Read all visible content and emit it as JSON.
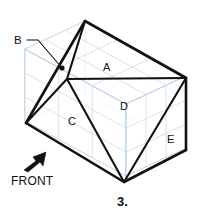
{
  "figure": {
    "number_label": "3.",
    "orientation_label": "FRONT",
    "callout_label": "B",
    "canvas": {
      "width": 197,
      "height": 217
    },
    "colors": {
      "background": "#ffffff",
      "grid": "#b9cfe4",
      "grid_faint": "#ccdcea",
      "edge": "#111111",
      "text": "#111111"
    },
    "face_labels": [
      {
        "id": "A",
        "text": "A",
        "x": 103,
        "y": 62
      },
      {
        "id": "C",
        "text": "C",
        "x": 68,
        "y": 116
      },
      {
        "id": "D",
        "text": "D",
        "x": 120,
        "y": 101
      },
      {
        "id": "E",
        "text": "E",
        "x": 167,
        "y": 134
      }
    ],
    "vertices": {
      "top_apex": {
        "x": 85,
        "y": 21
      },
      "right": {
        "x": 186,
        "y": 78
      },
      "left": {
        "x": 26,
        "y": 123
      },
      "bottom": {
        "x": 124,
        "y": 182
      },
      "center_junction": {
        "x": 67,
        "y": 79
      },
      "marked_point": {
        "x": 62,
        "y": 68
      },
      "right_lower": {
        "x": 186,
        "y": 150
      },
      "top_right_upper": {
        "x": 186,
        "y": 76
      }
    },
    "callout": {
      "label_x": 14,
      "label_y": 35,
      "leader_from": {
        "x": 27,
        "y": 40
      },
      "leader_bend": {
        "x": 38,
        "y": 40
      },
      "leader_to": {
        "x": 62,
        "y": 68
      }
    },
    "front_arrow": {
      "label_x": 11,
      "label_y": 175,
      "tail": {
        "x": 26,
        "y": 170
      },
      "tip": {
        "x": 46,
        "y": 152
      }
    },
    "figure_number_pos": {
      "x": 117,
      "y": 195
    }
  }
}
